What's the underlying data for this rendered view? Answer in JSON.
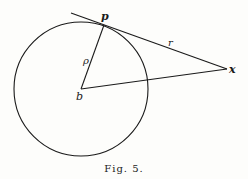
{
  "figure": {
    "caption": "Fig. 5.",
    "colors": {
      "ink": "#1a1a1a",
      "paper": "#fdfdfb"
    },
    "circle": {
      "center_label": "b",
      "cx": 81,
      "cy": 89,
      "r": 67
    },
    "points": {
      "p": {
        "label": "p",
        "x": 104,
        "y": 24
      },
      "x": {
        "label": "x",
        "x": 227,
        "y": 69
      },
      "b": {
        "label": "b",
        "x": 81,
        "y": 89
      }
    },
    "segments": [
      {
        "name": "tangent-line",
        "from": "tangent-start",
        "to": "x",
        "label": "r"
      },
      {
        "name": "radius-bp",
        "from": "b",
        "to": "p",
        "label": "ρ"
      },
      {
        "name": "segment-bx",
        "from": "b",
        "to": "x",
        "label": ""
      }
    ],
    "labels": {
      "p": "p",
      "x": "x",
      "b": "b",
      "rho": "ρ",
      "r": "r"
    }
  }
}
